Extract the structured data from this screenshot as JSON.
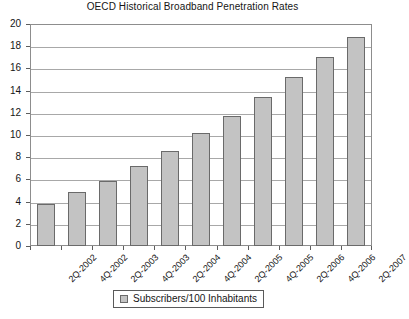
{
  "chart_data": {
    "type": "bar",
    "title": "OECD Historical Broadband Penetration Rates",
    "xlabel": "",
    "ylabel": "",
    "ylim": [
      0,
      20
    ],
    "ytick_step": 2,
    "yticks": [
      0,
      2,
      4,
      6,
      8,
      10,
      12,
      14,
      16,
      18,
      20
    ],
    "grid": true,
    "legend_position": "bottom-center",
    "categories": [
      "2Q-2002",
      "4Q-2002",
      "2Q-2003",
      "4Q-2003",
      "2Q-2004",
      "4Q-2004",
      "2Q-2005",
      "4Q-2005",
      "2Q-2006",
      "4Q-2006",
      "2Q-2007"
    ],
    "series": [
      {
        "name": "Subscribers/100 Inhabitants",
        "values": [
          3.8,
          4.9,
          5.9,
          7.2,
          8.6,
          10.2,
          11.7,
          13.4,
          15.2,
          17.0,
          18.8
        ],
        "color": "#c3c3c3",
        "border_color": "#6a6a6a"
      }
    ],
    "legend": [
      {
        "label": "Subscribers/100 Inhabitants",
        "color": "#c3c3c3"
      }
    ]
  },
  "style": {
    "background": "#ffffff",
    "frame_color": "#8d8d8d",
    "gridline_color": "#a8a8a8",
    "text_color": "#151515"
  }
}
